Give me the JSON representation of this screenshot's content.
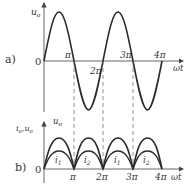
{
  "diagram": {
    "panel_a": {
      "label": "a)",
      "y_axis_label": "u",
      "y_axis_sub": "o",
      "origin_label": "0",
      "x_axis_label": "ωt",
      "ticks": [
        "π",
        "2π",
        "3π",
        "4π"
      ],
      "curve": "u_o sine wave, period 2π, from 0 to 4π"
    },
    "panel_b": {
      "label": "b)",
      "y_axis_label": "u",
      "y_axis_sub": "o",
      "y_axis_label_left": "i",
      "y_axis_label_left_sub": "o",
      "y_axis_label_left_rest": ",u",
      "y_axis_label_left_rest_sub": "o",
      "origin_label": "0",
      "x_axis_label": "ωt",
      "ticks": [
        "π",
        "2π",
        "3π",
        "4π"
      ],
      "curve_labels": [
        "i",
        "i",
        "i",
        "i"
      ],
      "curve_label_subs": [
        "1",
        "2",
        "1",
        "2"
      ],
      "curves": "full-wave rectified u_o (outer) and currents i1, i2 (inner) alternating each half-period"
    },
    "colors": {
      "stroke": "#2a2a2a",
      "axis": "#555555",
      "dash": "#777777"
    }
  }
}
